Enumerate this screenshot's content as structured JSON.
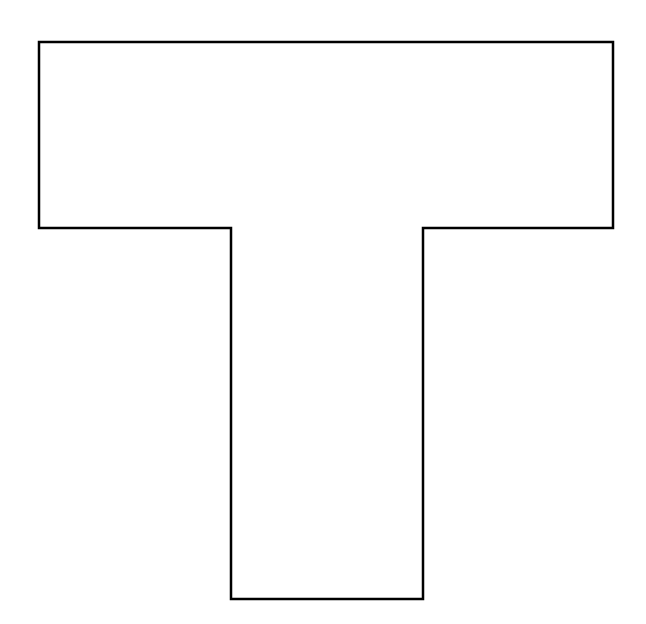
{
  "diagram": {
    "shape": "T-shape outline",
    "stroke_color": "#000000",
    "fill_color": "#ffffff",
    "stroke_width": 2.5,
    "points": "39,42 613,42 613,228 423,228 423,599 231,599 231,228 39,228"
  }
}
